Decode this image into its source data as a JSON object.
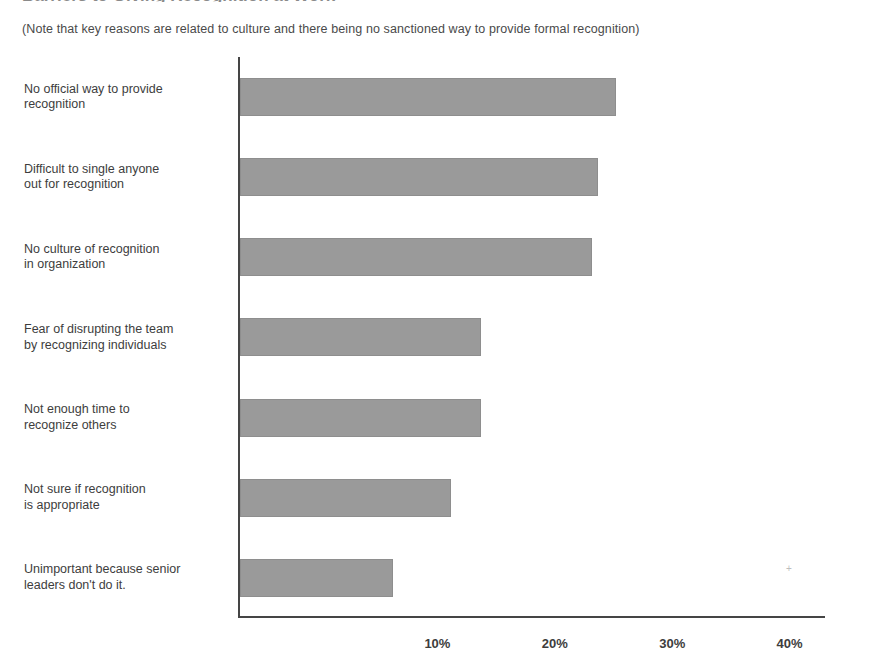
{
  "title": "Barriers to Giving Recognition at Work",
  "subtitle": "(Note that key reasons are related to culture and there being no sanctioned way to provide formal recognition)",
  "artifact_glyph": "+",
  "chart_data": {
    "type": "bar",
    "orientation": "horizontal",
    "title": "Barriers to Giving Recognition at Work",
    "subtitle": "(Note that key reasons are related to culture and there being no sanctioned way to provide formal recognition)",
    "xlabel": "",
    "ylabel": "",
    "xlim": [
      0,
      50
    ],
    "xticks": [
      10,
      20,
      30,
      40,
      50
    ],
    "xtick_labels": [
      "10%",
      "20%",
      "30%",
      "40%",
      "50%"
    ],
    "grid": false,
    "legend": false,
    "bar_color": "#9a9a9a",
    "axis_color": "#454545",
    "categories": [
      "Unimportant because senior leaders don't do it.",
      "Not sure if recognition is appropriate",
      "Not enough time to recognize others",
      "Fear of disrupting the team by recognizing individuals",
      "No culture of recognition in organization",
      "Difficult to single anyone out for recognition",
      "No official way to provide recognition"
    ],
    "categories_wrapped": [
      [
        "Unimportant because senior",
        "leaders don't do it."
      ],
      [
        "Not sure if recognition",
        "is appropriate"
      ],
      [
        "Not enough time to",
        "recognize others"
      ],
      [
        "Fear of disrupting the team",
        "by recognizing individuals"
      ],
      [
        "No culture of recognition",
        "in organization"
      ],
      [
        "Difficult to single anyone",
        "out for recognition"
      ],
      [
        "No official way to provide",
        "recognition"
      ]
    ],
    "values": [
      13,
      18,
      20.5,
      20.5,
      30,
      30.5,
      32
    ],
    "value_labels": [
      "13%",
      "18%",
      "20.5%",
      "20.5%",
      "30%",
      "30.5%",
      "32%"
    ]
  }
}
